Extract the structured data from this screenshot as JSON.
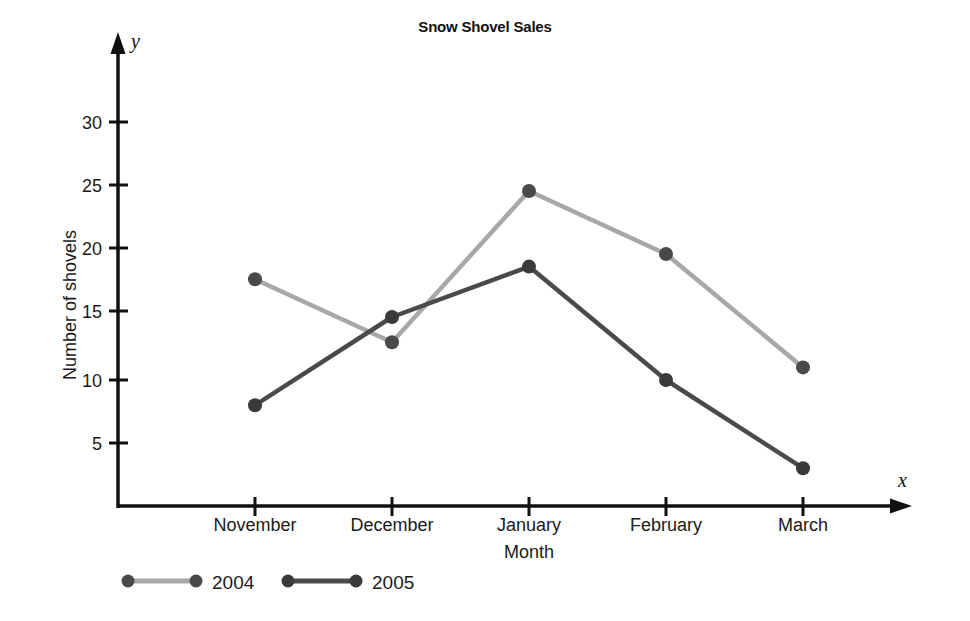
{
  "chart_data": {
    "type": "line",
    "title": "Snow Shovel Sales",
    "xlabel": "Month",
    "ylabel": "Number of shovels",
    "x_axis_variable": "x",
    "y_axis_variable": "y",
    "categories": [
      "November",
      "December",
      "January",
      "February",
      "March"
    ],
    "yticks": [
      5,
      10,
      15,
      20,
      25,
      30
    ],
    "ylim": [
      0,
      33
    ],
    "grid": false,
    "legend_position": "bottom-left",
    "series": [
      {
        "name": "2004",
        "values": [
          18,
          13,
          25,
          20,
          11
        ],
        "color": "#a8a8a8",
        "marker_color": "#4a4a4a"
      },
      {
        "name": "2005",
        "values": [
          8,
          15,
          19,
          10,
          3
        ],
        "color": "#4a4a4a",
        "marker_color": "#3a3a3a"
      }
    ]
  },
  "axis": {
    "tick_labels": [
      "5",
      "10",
      "15",
      "20",
      "25",
      "30"
    ]
  },
  "legend": {
    "entries": [
      {
        "label": "2004"
      },
      {
        "label": "2005"
      }
    ]
  }
}
